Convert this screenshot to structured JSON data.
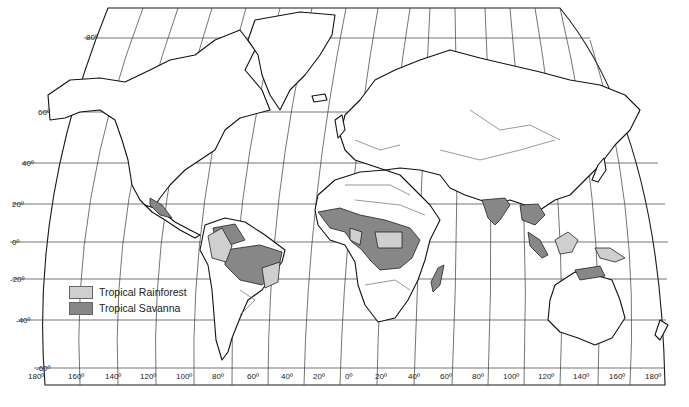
{
  "map": {
    "title": "World Tropical Climate Regions",
    "projection": "pseudo-conic world projection with graticule",
    "latitude_labels": [
      {
        "label": "80º",
        "y": 37
      },
      {
        "label": "60º",
        "y": 113
      },
      {
        "label": "40º",
        "y": 163
      },
      {
        "label": "20º",
        "y": 204
      },
      {
        "label": "0º",
        "y": 242
      },
      {
        "label": "-20º",
        "y": 279
      },
      {
        "label": "-40º",
        "y": 320
      },
      {
        "label": "-60º",
        "y": 368
      }
    ],
    "longitude_labels": [
      "180º",
      "160º",
      "140º",
      "120º",
      "100º",
      "80º",
      "60º",
      "40º",
      "20º",
      "0º",
      "20º",
      "40º",
      "60º",
      "80º",
      "100º",
      "120º",
      "140º",
      "160º",
      "180º"
    ],
    "colors": {
      "tropical_rainforest": "#cfcfcf",
      "tropical_savanna": "#878787",
      "land": "#ffffff",
      "outline": "#111111",
      "graticule": "#3a3a3a"
    }
  },
  "legend": {
    "items": [
      {
        "label": "Tropical Rainforest",
        "color": "#cfcfcf"
      },
      {
        "label": "Tropical Savanna",
        "color": "#878787"
      }
    ]
  }
}
